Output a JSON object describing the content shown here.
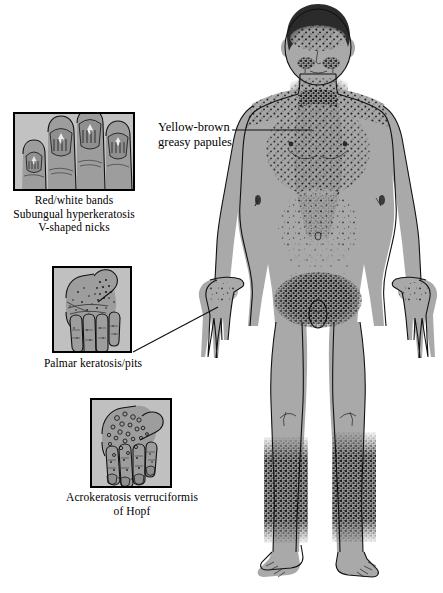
{
  "figure": {
    "background_color": "#ffffff",
    "ink_color": "#000000",
    "skin_tone": "#a9a9a9",
    "lesion_color": "#1c1c1c"
  },
  "annotations": [
    {
      "id": "yellow-brown-papules",
      "text": "Yellow-brown\ngreasy papules",
      "x": 158,
      "y": 120,
      "leader": {
        "x1": 232,
        "y1": 130,
        "x2": 312,
        "y2": 130
      },
      "target": "central chest and upper trunk"
    }
  ],
  "insets": [
    {
      "id": "nail-changes",
      "box": {
        "x": 13,
        "y": 112,
        "w": 122,
        "h": 79
      },
      "caption": "Red/white bands\nSubungual hyperkeratosis\nV-shaped nicks",
      "caption_x": 6,
      "caption_y": 194,
      "caption_w": 136,
      "subject": "fingernails-close-up",
      "leader": null
    },
    {
      "id": "palmar-keratosis",
      "box": {
        "x": 52,
        "y": 266,
        "w": 80,
        "h": 87
      },
      "caption": "Palmar keratosis/pits",
      "caption_x": 30,
      "caption_y": 357,
      "caption_w": 126,
      "subject": "palm-of-hand",
      "leader": {
        "x1": 133,
        "y1": 352,
        "x2": 218,
        "y2": 307
      }
    },
    {
      "id": "acrokeratosis-verruciformis",
      "box": {
        "x": 90,
        "y": 398,
        "w": 82,
        "h": 90
      },
      "caption": "Acrokeratosis verruciformis\nof Hopf",
      "caption_x": 44,
      "caption_y": 491,
      "caption_w": 176,
      "subject": "dorsum-of-hand",
      "leader": null
    }
  ],
  "affected_regions": [
    "forehead and scalp margin",
    "nasolabial folds",
    "neck",
    "upper chest and shoulders",
    "sternal / central trunk",
    "abdomen",
    "groin",
    "dorsal hands",
    "shins"
  ]
}
